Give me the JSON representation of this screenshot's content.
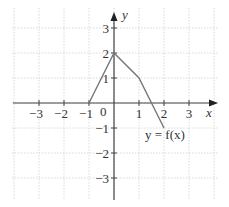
{
  "chart_data": {
    "type": "line",
    "title": "",
    "xlabel": "x",
    "ylabel": "y",
    "xlim": [
      -3.6,
      4
    ],
    "ylim": [
      -3.9,
      3.9
    ],
    "grid": true,
    "x_ticks": [
      -3,
      -2,
      -1,
      1,
      2,
      3
    ],
    "x_tick_labels": [
      "−3",
      "−2",
      "−1",
      "1",
      "2",
      "3"
    ],
    "y_ticks": [
      3,
      2,
      1,
      -1,
      -2,
      -3
    ],
    "y_tick_labels": [
      "3",
      "2",
      "1",
      "−1",
      "−2",
      "−3"
    ],
    "origin_label": "0",
    "series": [
      {
        "name": "y = f(x)",
        "points": [
          [
            -1,
            0
          ],
          [
            0,
            2
          ],
          [
            1,
            1
          ],
          [
            2,
            -1
          ]
        ]
      }
    ],
    "annotations": [
      {
        "text": "y = f(x)",
        "x": 1.55,
        "y": -1.45
      }
    ]
  },
  "labels": {
    "x_axis": "x",
    "y_axis": "y",
    "origin": "0",
    "curve_label": "y = f(x)"
  }
}
